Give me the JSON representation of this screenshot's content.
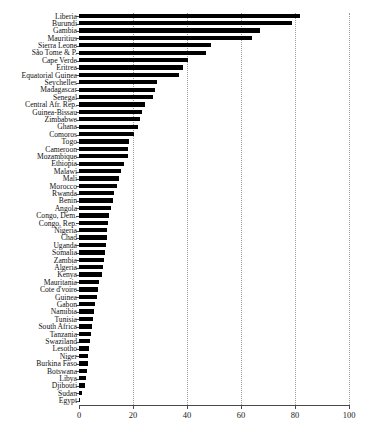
{
  "chart_data": {
    "type": "bar",
    "orientation": "horizontal",
    "title": "",
    "xlabel": "",
    "ylabel": "",
    "xlim": [
      0,
      100
    ],
    "xticks": [
      0,
      20,
      40,
      60,
      80,
      100
    ],
    "xtick_labels": [
      "0",
      "20",
      "40",
      "60",
      "80",
      "100"
    ],
    "grid": "vertical-dotted",
    "legend": "none",
    "bar_color": "#000000",
    "axis_color": "#4a4a4a",
    "categories": [
      "Liberia",
      "Burundi",
      "Gambia",
      "Mauritius",
      "Sierra Leone",
      "São Tome & P.",
      "Cape Verde",
      "Eritrea",
      "Equatorial Guinea",
      "Seychelles",
      "Madagascar",
      "Senegal",
      "Central Afr. Rep.",
      "Guinea-Bissau",
      "Zimbabwe",
      "Ghana",
      "Comoros",
      "Togo",
      "Cameroon",
      "Mozambique",
      "Ethiopia",
      "Malawi",
      "Mali",
      "Morocco",
      "Rwanda",
      "Benin",
      "Angola",
      "Congo, Dem.",
      "Congo, Rep.",
      "Nigeria",
      "Chad",
      "Uganda",
      "Somalia",
      "Zambia",
      "Algeria",
      "Kenya",
      "Mauritania",
      "Cote d'voire",
      "Guinea",
      "Gabon",
      "Namibia",
      "Tunisia",
      "South Africa",
      "Tanzania",
      "Swaziland",
      "Lesotho",
      "Niger",
      "Burkina Faso",
      "Botswana",
      "Libya",
      "Djibouti",
      "Sudan",
      "Egypt"
    ],
    "values": [
      82.0,
      79.0,
      67.0,
      64.0,
      49.0,
      47.0,
      40.5,
      38.5,
      37.0,
      29.0,
      28.0,
      27.5,
      24.5,
      23.5,
      22.5,
      22.0,
      20.5,
      18.5,
      18.2,
      18.0,
      16.5,
      15.5,
      14.8,
      14.2,
      13.0,
      12.5,
      12.0,
      11.0,
      10.8,
      10.5,
      10.2,
      10.0,
      9.5,
      9.2,
      9.0,
      8.5,
      7.5,
      7.0,
      6.5,
      6.0,
      5.5,
      5.0,
      4.8,
      4.5,
      4.0,
      3.8,
      3.5,
      3.2,
      3.0,
      2.5,
      2.2,
      1.0,
      0.4
    ]
  }
}
